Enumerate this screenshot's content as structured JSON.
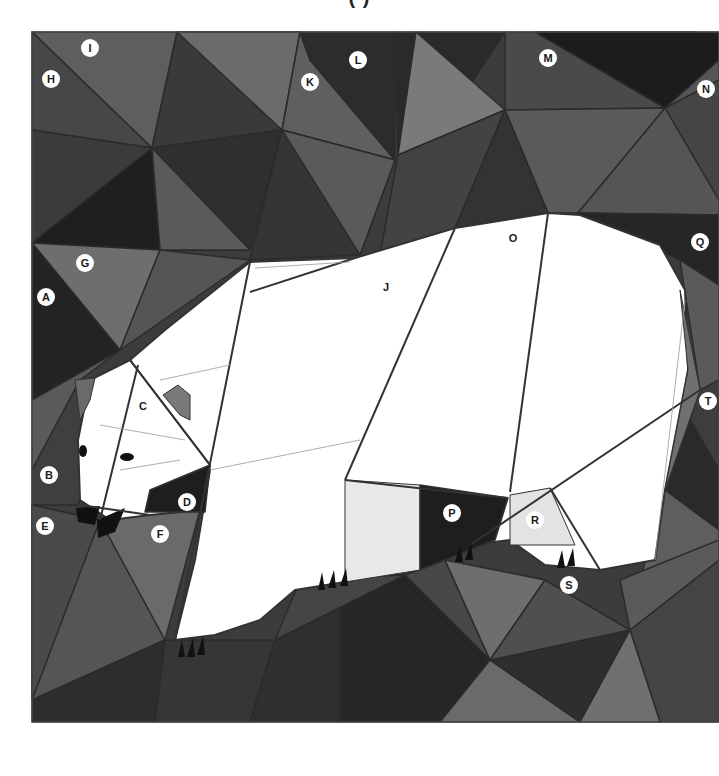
{
  "title_fragment": "(                    )",
  "colors": {
    "black": "#1c1c1c",
    "very_dark": "#2a2a2a",
    "dark": "#3a3a3a",
    "mid_dark": "#4a4a4a",
    "mid": "#5a5a5a",
    "mid_light": "#6a6a6a",
    "light": "#7a7a7a",
    "bear": "#ffffff",
    "bear_shade": "#e6e6e6",
    "seam": "#333333"
  },
  "labels": [
    {
      "id": "I",
      "x": 90,
      "y": 48,
      "circled": true
    },
    {
      "id": "H",
      "x": 51,
      "y": 79,
      "circled": true
    },
    {
      "id": "L",
      "x": 358,
      "y": 60,
      "circled": true
    },
    {
      "id": "K",
      "x": 310,
      "y": 82,
      "circled": true
    },
    {
      "id": "M",
      "x": 548,
      "y": 58,
      "circled": true
    },
    {
      "id": "N",
      "x": 706,
      "y": 89,
      "circled": true
    },
    {
      "id": "G",
      "x": 85,
      "y": 263,
      "circled": true
    },
    {
      "id": "A",
      "x": 46,
      "y": 297,
      "circled": true
    },
    {
      "id": "O",
      "x": 513,
      "y": 238,
      "circled": false
    },
    {
      "id": "Q",
      "x": 700,
      "y": 242,
      "circled": true
    },
    {
      "id": "J",
      "x": 386,
      "y": 287,
      "circled": false
    },
    {
      "id": "C",
      "x": 143,
      "y": 406,
      "circled": false
    },
    {
      "id": "T",
      "x": 708,
      "y": 401,
      "circled": true
    },
    {
      "id": "B",
      "x": 49,
      "y": 475,
      "circled": true
    },
    {
      "id": "D",
      "x": 187,
      "y": 502,
      "circled": true
    },
    {
      "id": "E",
      "x": 45,
      "y": 526,
      "circled": true
    },
    {
      "id": "F",
      "x": 160,
      "y": 534,
      "circled": true
    },
    {
      "id": "P",
      "x": 452,
      "y": 513,
      "circled": true
    },
    {
      "id": "R",
      "x": 535,
      "y": 520,
      "circled": true
    },
    {
      "id": "S",
      "x": 569,
      "y": 585,
      "circled": true
    }
  ]
}
